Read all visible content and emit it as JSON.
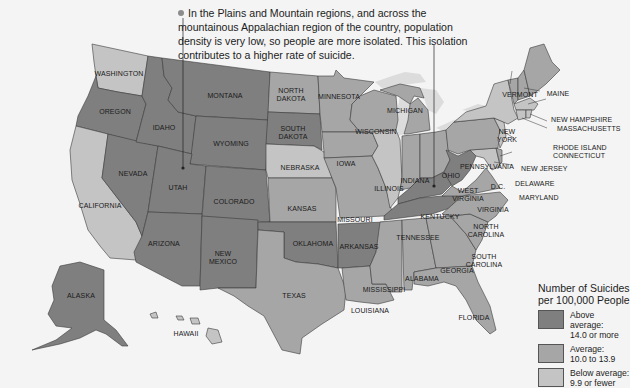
{
  "callout": {
    "text": "In the Plains and Mountain regions, and across the mountainous Appalachian region of the country, population density is very low, so people are more isolated. This isolation contributes to a higher rate of suicide."
  },
  "legend": {
    "title_line1": "Number of Suicides",
    "title_line2": "per 100,000 People",
    "items": [
      {
        "label": "Above average:",
        "range": "14.0 or more",
        "color": "#7f7f7f"
      },
      {
        "label": "Average:",
        "range": "10.0 to 13.9",
        "color": "#a6a6a6"
      },
      {
        "label": "Below average:",
        "range": "9.9 or fewer",
        "color": "#c4c4c4"
      }
    ]
  },
  "colors": {
    "above": "#7f7f7f",
    "average": "#a6a6a6",
    "below": "#c4c4c4",
    "lakes": "#dcdcdc",
    "background": "#f4f4f4"
  },
  "states": [
    {
      "name": "WASHINGTON",
      "category": "below"
    },
    {
      "name": "OREGON",
      "category": "above"
    },
    {
      "name": "CALIFORNIA",
      "category": "below"
    },
    {
      "name": "NEVADA",
      "category": "above"
    },
    {
      "name": "IDAHO",
      "category": "above"
    },
    {
      "name": "MONTANA",
      "category": "above"
    },
    {
      "name": "WYOMING",
      "category": "above"
    },
    {
      "name": "UTAH",
      "category": "above"
    },
    {
      "name": "COLORADO",
      "category": "above"
    },
    {
      "name": "ARIZONA",
      "category": "above"
    },
    {
      "name": "NEW MEXICO",
      "category": "above"
    },
    {
      "name": "NORTH DAKOTA",
      "category": "average"
    },
    {
      "name": "SOUTH DAKOTA",
      "category": "above"
    },
    {
      "name": "NEBRASKA",
      "category": "below"
    },
    {
      "name": "KANSAS",
      "category": "average"
    },
    {
      "name": "OKLAHOMA",
      "category": "above"
    },
    {
      "name": "TEXAS",
      "category": "average"
    },
    {
      "name": "MINNESOTA",
      "category": "average"
    },
    {
      "name": "IOWA",
      "category": "average"
    },
    {
      "name": "MISSOURI",
      "category": "average"
    },
    {
      "name": "ARKANSAS",
      "category": "above"
    },
    {
      "name": "LOUISIANA",
      "category": "average"
    },
    {
      "name": "WISCONSIN",
      "category": "average"
    },
    {
      "name": "ILLINOIS",
      "category": "below"
    },
    {
      "name": "MICHIGAN",
      "category": "average"
    },
    {
      "name": "INDIANA",
      "category": "average"
    },
    {
      "name": "OHIO",
      "category": "average"
    },
    {
      "name": "KENTUCKY",
      "category": "above"
    },
    {
      "name": "TENNESSEE",
      "category": "above"
    },
    {
      "name": "MISSISSIPPI",
      "category": "average"
    },
    {
      "name": "ALABAMA",
      "category": "average"
    },
    {
      "name": "GEORGIA",
      "category": "average"
    },
    {
      "name": "FLORIDA",
      "category": "average"
    },
    {
      "name": "SOUTH CAROLINA",
      "category": "average"
    },
    {
      "name": "NORTH CAROLINA",
      "category": "average"
    },
    {
      "name": "VIRGINIA",
      "category": "average"
    },
    {
      "name": "WEST VIRGINIA",
      "category": "above"
    },
    {
      "name": "PENNSYLVANIA",
      "category": "average"
    },
    {
      "name": "NEW YORK",
      "category": "below"
    },
    {
      "name": "VERMONT",
      "category": "average"
    },
    {
      "name": "NEW HAMPSHIRE",
      "category": "average"
    },
    {
      "name": "MAINE",
      "category": "average"
    },
    {
      "name": "MASSACHUSETTS",
      "category": "below"
    },
    {
      "name": "RHODE ISLAND",
      "category": "below"
    },
    {
      "name": "CONNECTICUT",
      "category": "below"
    },
    {
      "name": "NEW JERSEY",
      "category": "below"
    },
    {
      "name": "DELAWARE",
      "category": "average"
    },
    {
      "name": "MARYLAND",
      "category": "below"
    },
    {
      "name": "D.C.",
      "category": "below"
    },
    {
      "name": "ALASKA",
      "category": "above"
    },
    {
      "name": "HAWAII",
      "category": "below"
    }
  ],
  "labels": {
    "WA": "WASHINGTON",
    "OR": "OREGON",
    "CA": "CALIFORNIA",
    "NV": "NEVADA",
    "ID": "IDAHO",
    "MT": "MONTANA",
    "WY": "WYOMING",
    "UT": "UTAH",
    "CO": "COLORADO",
    "AZ": "ARIZONA",
    "NM1": "NEW",
    "NM2": "MEXICO",
    "ND1": "NORTH",
    "ND2": "DAKOTA",
    "SD1": "SOUTH",
    "SD2": "DAKOTA",
    "NE": "NEBRASKA",
    "KS": "KANSAS",
    "OK": "OKLAHOMA",
    "TX": "TEXAS",
    "MN": "MINNESOTA",
    "IA": "IOWA",
    "MO": "MISSOURI",
    "AR": "ARKANSAS",
    "LA": "LOUISIANA",
    "WI": "WISCONSIN",
    "IL": "ILLINOIS",
    "MI": "MICHIGAN",
    "IN": "INDIANA",
    "OH": "OHIO",
    "KY": "KENTUCKY",
    "TN": "TENNESSEE",
    "MS": "MISSISSIPPI",
    "AL": "ALABAMA",
    "GA": "GEORGIA",
    "FL": "FLORIDA",
    "SC1": "SOUTH",
    "SC2": "CAROLINA",
    "NC1": "NORTH",
    "NC2": "CAROLINA",
    "VA": "VIRGINIA",
    "WV1": "WEST",
    "WV2": "VIRGINIA",
    "PA": "PENNSYLVANIA",
    "NY1": "NEW",
    "NY2": "YORK",
    "VT": "VERMONT",
    "NH": "NEW HAMPSHIRE",
    "ME": "MAINE",
    "MA": "MASSACHUSETTS",
    "RI": "RHODE ISLAND",
    "CT": "CONNECTICUT",
    "NJ": "NEW JERSEY",
    "DE": "DELAWARE",
    "MD": "MARYLAND",
    "DC": "D.C.",
    "AK": "ALASKA",
    "HI": "HAWAII"
  }
}
